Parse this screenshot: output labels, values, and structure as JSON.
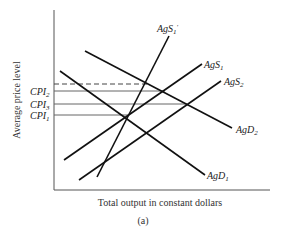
{
  "figure": {
    "caption": "(a)",
    "x_axis_label": "Total output in constant dollars",
    "y_axis_label": "Average price level"
  },
  "price_levels": [
    {
      "name": "CPI",
      "sub": "2",
      "y": 91
    },
    {
      "name": "CPI",
      "sub": "3",
      "y": 104
    },
    {
      "name": "CPI",
      "sub": "1",
      "y": 115
    }
  ],
  "curves": {
    "agd1": {
      "name": "AgD",
      "sub": "1",
      "prime": ""
    },
    "agd2": {
      "name": "AgD",
      "sub": "2",
      "prime": ""
    },
    "ags1": {
      "name": "AgS",
      "sub": "1",
      "prime": ""
    },
    "ags1p": {
      "name": "AgS",
      "sub": "1",
      "prime": "′"
    },
    "ags2": {
      "name": "AgS",
      "sub": "2",
      "prime": ""
    }
  },
  "colors": {
    "ink": "#222222",
    "guide": "#555555",
    "background": "#ffffff"
  }
}
